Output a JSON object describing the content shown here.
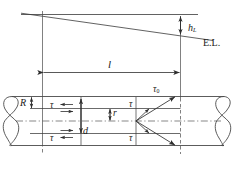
{
  "figure": {
    "type": "engineering-diagram",
    "labels": {
      "head_loss": "h",
      "head_loss_sub": "L",
      "energy_line": "E.L.",
      "length": "l",
      "pipe_radius": "R",
      "pipe_diameter": "d",
      "local_radius": "r",
      "wall_shear": "τ",
      "wall_shear_sub": "0",
      "shear_upper": "τ",
      "shear_lower": "τ",
      "shear_left_upper": "τ",
      "shear_left_lower": "τ",
      "shear_mid_upper": "τ",
      "shear_mid_lower": "τ"
    },
    "colors": {
      "line": "#3a3a3a",
      "outline": "#4a4a4a",
      "dash": "#555555",
      "text": "#141414",
      "background": "#ffffff"
    }
  }
}
